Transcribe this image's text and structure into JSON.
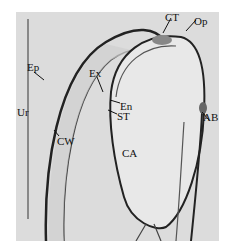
{
  "figure": {
    "type": "light micrograph, longitudinal section",
    "labels": [
      {
        "id": "CT",
        "text": "CT",
        "x": 165,
        "y": 12
      },
      {
        "id": "Op",
        "text": "Op",
        "x": 194,
        "y": 16
      },
      {
        "id": "Ep",
        "text": "Ep",
        "x": 27,
        "y": 62
      },
      {
        "id": "Ex",
        "text": "Ex",
        "x": 89,
        "y": 68
      },
      {
        "id": "En",
        "text": "En",
        "x": 120,
        "y": 101
      },
      {
        "id": "ST",
        "text": "ST",
        "x": 117,
        "y": 111
      },
      {
        "id": "Ur",
        "text": "Ur",
        "x": 17,
        "y": 107
      },
      {
        "id": "AB",
        "text": "AB",
        "x": 203,
        "y": 112
      },
      {
        "id": "CW",
        "text": "CW",
        "x": 57,
        "y": 136
      },
      {
        "id": "CA",
        "text": "CA",
        "x": 122,
        "y": 148
      }
    ],
    "scale_bar": {
      "visible": true,
      "orientation": "vertical"
    },
    "colors": {
      "background": "#dcdcdc",
      "tissue_outline": "#222222",
      "cell_fill": "#eeeeee"
    }
  }
}
